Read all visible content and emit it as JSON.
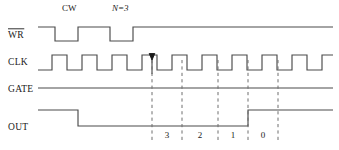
{
  "figure": {
    "type": "digital-timing-diagram",
    "width": 339,
    "height": 150,
    "background_color": "#ffffff",
    "wave_color": "#4a4a4a",
    "marker_color": "#6e6e6e",
    "text_color": "#1a1a1a"
  },
  "annotations": {
    "cw": {
      "text": "CW",
      "x": 62,
      "y": 11
    },
    "n_value": {
      "text": "N=3",
      "x": 112,
      "y": 11,
      "italic_prefix": "N"
    }
  },
  "signals": [
    {
      "name": "WR",
      "label": "WR",
      "overbar": true,
      "active_low": true,
      "label_x": 8,
      "label_y": 38,
      "baseline_y": 41,
      "high_y": 27,
      "x_start": 38,
      "x_end": 333,
      "initial_level": "high",
      "transitions": [
        {
          "x": 55,
          "level": "low"
        },
        {
          "x": 78,
          "level": "high"
        },
        {
          "x": 110,
          "level": "low"
        },
        {
          "x": 133,
          "level": "high"
        }
      ]
    },
    {
      "name": "CLK",
      "label": "CLK",
      "overbar": false,
      "label_x": 8,
      "label_y": 65,
      "baseline_y": 70,
      "high_y": 55,
      "x_start": 38,
      "x_end": 333,
      "initial_level": "low",
      "period": 30,
      "first_rise_x": 52,
      "duty_high": 15,
      "pulse_count": 10,
      "arrow": {
        "x": 152,
        "y_top": 55,
        "y_bottom": 74,
        "direction": "down"
      }
    },
    {
      "name": "GATE",
      "label": "GATE",
      "overbar": false,
      "label_x": 8,
      "label_y": 92,
      "baseline_y": 96,
      "high_y": 88,
      "x_start": 38,
      "x_end": 333,
      "initial_level": "high",
      "transitions": []
    },
    {
      "name": "OUT",
      "label": "OUT",
      "overbar": false,
      "label_x": 8,
      "label_y": 130,
      "baseline_y": 126,
      "high_y": 110,
      "x_start": 38,
      "x_end": 333,
      "initial_level": "high",
      "transitions": [
        {
          "x": 78,
          "level": "low"
        },
        {
          "x": 248,
          "level": "high"
        }
      ]
    }
  ],
  "markers": {
    "y_top": 60,
    "y_bottom": 140,
    "x_positions": [
      152,
      182,
      218,
      248,
      278
    ]
  },
  "count_labels": [
    {
      "text": "3",
      "x": 167,
      "y": 138
    },
    {
      "text": "2",
      "x": 200,
      "y": 138
    },
    {
      "text": "1",
      "x": 233,
      "y": 138
    },
    {
      "text": "0",
      "x": 263,
      "y": 138
    }
  ]
}
